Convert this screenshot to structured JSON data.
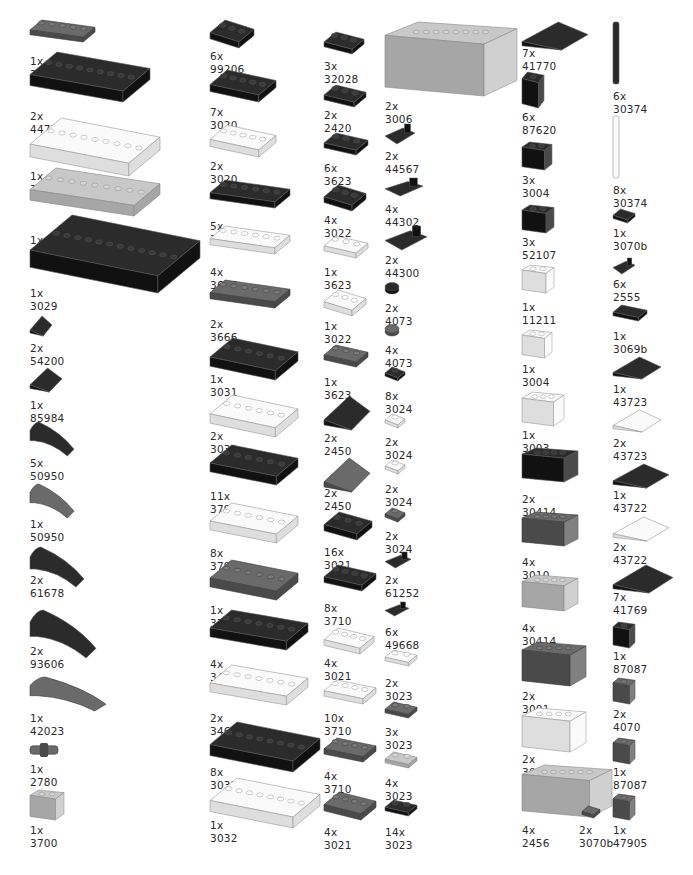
{
  "colors": {
    "black": "#1b1b1b",
    "dark_gray": "#5b5b5b",
    "light_gray": "#b9b9b9",
    "white": "#f4f4f4",
    "label": "#2a2a2a"
  },
  "parts": [
    {
      "qty": "1x",
      "id": "3020",
      "shape": "plate",
      "color": "dark_gray",
      "x": 30,
      "y": 20,
      "w": 65,
      "h": 22,
      "lx": 30,
      "ly": 55
    },
    {
      "qty": "2x",
      "id": "4477",
      "shape": "plate",
      "color": "black",
      "x": 30,
      "y": 52,
      "w": 120,
      "h": 50,
      "lx": 30,
      "ly": 110
    },
    {
      "qty": "1x",
      "id": "3958",
      "shape": "plate",
      "color": "white",
      "x": 30,
      "y": 118,
      "w": 130,
      "h": 58,
      "lx": 30,
      "ly": 170
    },
    {
      "qty": "1x",
      "id": "3832",
      "shape": "plate",
      "color": "light_gray",
      "x": 30,
      "y": 168,
      "w": 130,
      "h": 48,
      "lx": 30,
      "ly": 234
    },
    {
      "qty": "1x",
      "id": "3029",
      "shape": "plate",
      "color": "black",
      "x": 30,
      "y": 215,
      "w": 170,
      "h": 78,
      "lx": 30,
      "ly": 287
    },
    {
      "qty": "2x",
      "id": "54200",
      "shape": "slope",
      "color": "black",
      "x": 30,
      "y": 316,
      "w": 22,
      "h": 20,
      "lx": 30,
      "ly": 342
    },
    {
      "qty": "1x",
      "id": "85984",
      "shape": "slope",
      "color": "black",
      "x": 30,
      "y": 368,
      "w": 32,
      "h": 24,
      "lx": 30,
      "ly": 399
    },
    {
      "qty": "5x",
      "id": "50950",
      "shape": "curve",
      "color": "black",
      "x": 30,
      "y": 422,
      "w": 44,
      "h": 34,
      "lx": 30,
      "ly": 457
    },
    {
      "qty": "1x",
      "id": "50950",
      "shape": "curve",
      "color": "dark_gray",
      "x": 30,
      "y": 484,
      "w": 44,
      "h": 34,
      "lx": 30,
      "ly": 518
    },
    {
      "qty": "2x",
      "id": "61678",
      "shape": "curve",
      "color": "black",
      "x": 30,
      "y": 547,
      "w": 54,
      "h": 40,
      "lx": 30,
      "ly": 574
    },
    {
      "qty": "2x",
      "id": "93606",
      "shape": "curve",
      "color": "black",
      "x": 30,
      "y": 610,
      "w": 66,
      "h": 48,
      "lx": 30,
      "ly": 645
    },
    {
      "qty": "1x",
      "id": "42023",
      "shape": "curve",
      "color": "dark_gray",
      "x": 30,
      "y": 677,
      "w": 76,
      "h": 34,
      "lx": 30,
      "ly": 712
    },
    {
      "qty": "1x",
      "id": "2780",
      "shape": "pin",
      "color": "dark_gray",
      "x": 30,
      "y": 743,
      "w": 28,
      "h": 14,
      "lx": 30,
      "ly": 763
    },
    {
      "qty": "1x",
      "id": "3700",
      "shape": "brick",
      "color": "light_gray",
      "x": 30,
      "y": 790,
      "w": 34,
      "h": 30,
      "lx": 30,
      "ly": 824
    },
    {
      "qty": "6x",
      "id": "99206",
      "shape": "plate",
      "color": "black",
      "x": 210,
      "y": 20,
      "w": 44,
      "h": 28,
      "lx": 210,
      "ly": 50
    },
    {
      "qty": "7x",
      "id": "3020",
      "shape": "plate",
      "color": "black",
      "x": 210,
      "y": 70,
      "w": 66,
      "h": 32,
      "lx": 210,
      "ly": 106
    },
    {
      "qty": "2x",
      "id": "3020",
      "shape": "plate",
      "color": "white",
      "x": 210,
      "y": 125,
      "w": 66,
      "h": 32,
      "lx": 210,
      "ly": 160
    },
    {
      "qty": "5x",
      "id": "3666",
      "shape": "plate",
      "color": "black",
      "x": 210,
      "y": 180,
      "w": 80,
      "h": 28,
      "lx": 210,
      "ly": 220
    },
    {
      "qty": "4x",
      "id": "3666",
      "shape": "plate",
      "color": "white",
      "x": 210,
      "y": 226,
      "w": 80,
      "h": 28,
      "lx": 210,
      "ly": 266
    },
    {
      "qty": "2x",
      "id": "3666",
      "shape": "plate",
      "color": "dark_gray",
      "x": 210,
      "y": 280,
      "w": 80,
      "h": 28,
      "lx": 210,
      "ly": 318
    },
    {
      "qty": "1x",
      "id": "3031",
      "shape": "plate",
      "color": "black",
      "x": 210,
      "y": 338,
      "w": 88,
      "h": 42,
      "lx": 210,
      "ly": 373
    },
    {
      "qty": "2x",
      "id": "3031",
      "shape": "plate",
      "color": "white",
      "x": 210,
      "y": 395,
      "w": 88,
      "h": 42,
      "lx": 210,
      "ly": 430
    },
    {
      "qty": "11x",
      "id": "3795",
      "shape": "plate",
      "color": "black",
      "x": 210,
      "y": 445,
      "w": 88,
      "h": 40,
      "lx": 210,
      "ly": 490
    },
    {
      "qty": "8x",
      "id": "3795",
      "shape": "plate",
      "color": "white",
      "x": 210,
      "y": 503,
      "w": 88,
      "h": 40,
      "lx": 210,
      "ly": 547
    },
    {
      "qty": "1x",
      "id": "3795",
      "shape": "plate",
      "color": "dark_gray",
      "x": 210,
      "y": 560,
      "w": 88,
      "h": 40,
      "lx": 210,
      "ly": 604
    },
    {
      "qty": "4x",
      "id": "3460",
      "shape": "plate",
      "color": "black",
      "x": 210,
      "y": 610,
      "w": 98,
      "h": 40,
      "lx": 210,
      "ly": 658
    },
    {
      "qty": "2x",
      "id": "3460",
      "shape": "plate",
      "color": "white",
      "x": 210,
      "y": 665,
      "w": 98,
      "h": 40,
      "lx": 210,
      "ly": 712
    },
    {
      "qty": "8x",
      "id": "3032",
      "shape": "plate",
      "color": "black",
      "x": 210,
      "y": 722,
      "w": 110,
      "h": 50,
      "lx": 210,
      "ly": 766
    },
    {
      "qty": "1x",
      "id": "3032",
      "shape": "plate",
      "color": "white",
      "x": 210,
      "y": 778,
      "w": 110,
      "h": 50,
      "lx": 210,
      "ly": 819
    },
    {
      "qty": "3x",
      "id": "32028",
      "shape": "plate",
      "color": "black",
      "x": 324,
      "y": 32,
      "w": 40,
      "h": 22,
      "lx": 324,
      "ly": 60
    },
    {
      "qty": "2x",
      "id": "2420",
      "shape": "plate",
      "color": "black",
      "x": 324,
      "y": 85,
      "w": 42,
      "h": 22,
      "lx": 324,
      "ly": 109
    },
    {
      "qty": "6x",
      "id": "3623",
      "shape": "plate",
      "color": "black",
      "x": 324,
      "y": 133,
      "w": 44,
      "h": 22,
      "lx": 324,
      "ly": 162
    },
    {
      "qty": "4x",
      "id": "3022",
      "shape": "plate",
      "color": "black",
      "x": 324,
      "y": 185,
      "w": 42,
      "h": 26,
      "lx": 324,
      "ly": 214
    },
    {
      "qty": "1x",
      "id": "3623",
      "shape": "plate",
      "color": "white",
      "x": 324,
      "y": 236,
      "w": 44,
      "h": 22,
      "lx": 324,
      "ly": 266
    },
    {
      "qty": "1x",
      "id": "3022",
      "shape": "plate",
      "color": "white",
      "x": 324,
      "y": 290,
      "w": 42,
      "h": 26,
      "lx": 324,
      "ly": 320
    },
    {
      "qty": "1x",
      "id": "3623",
      "shape": "plate",
      "color": "dark_gray",
      "x": 324,
      "y": 345,
      "w": 44,
      "h": 22,
      "lx": 324,
      "ly": 376
    },
    {
      "qty": "2x",
      "id": "2450",
      "shape": "wedge",
      "color": "black",
      "x": 324,
      "y": 396,
      "w": 46,
      "h": 34,
      "lx": 324,
      "ly": 432
    },
    {
      "qty": "2x",
      "id": "2450",
      "shape": "wedge",
      "color": "dark_gray",
      "x": 324,
      "y": 458,
      "w": 46,
      "h": 34,
      "lx": 324,
      "ly": 487
    },
    {
      "qty": "16x",
      "id": "3021",
      "shape": "plate",
      "color": "black",
      "x": 324,
      "y": 512,
      "w": 48,
      "h": 28,
      "lx": 324,
      "ly": 546
    },
    {
      "qty": "8x",
      "id": "3710",
      "shape": "plate",
      "color": "black",
      "x": 324,
      "y": 565,
      "w": 52,
      "h": 26,
      "lx": 324,
      "ly": 602
    },
    {
      "qty": "4x",
      "id": "3021",
      "shape": "plate",
      "color": "white",
      "x": 324,
      "y": 628,
      "w": 50,
      "h": 26,
      "lx": 324,
      "ly": 657
    },
    {
      "qty": "10x",
      "id": "3710",
      "shape": "plate",
      "color": "white",
      "x": 324,
      "y": 680,
      "w": 52,
      "h": 24,
      "lx": 324,
      "ly": 712
    },
    {
      "qty": "4x",
      "id": "3710",
      "shape": "plate",
      "color": "dark_gray",
      "x": 324,
      "y": 738,
      "w": 52,
      "h": 24,
      "lx": 324,
      "ly": 770
    },
    {
      "qty": "4x",
      "id": "3021",
      "shape": "plate",
      "color": "dark_gray",
      "x": 324,
      "y": 792,
      "w": 52,
      "h": 28,
      "lx": 324,
      "ly": 826
    },
    {
      "qty": "2x",
      "id": "3006",
      "shape": "brick",
      "color": "light_gray",
      "x": 385,
      "y": 22,
      "w": 132,
      "h": 74,
      "lx": 385,
      "ly": 100
    },
    {
      "qty": "2x",
      "id": "44567",
      "shape": "clip",
      "color": "black",
      "x": 385,
      "y": 124,
      "w": 30,
      "h": 20,
      "lx": 385,
      "ly": 150
    },
    {
      "qty": "4x",
      "id": "44302",
      "shape": "clip",
      "color": "black",
      "x": 385,
      "y": 178,
      "w": 38,
      "h": 18,
      "lx": 385,
      "ly": 203
    },
    {
      "qty": "2x",
      "id": "44300",
      "shape": "clip",
      "color": "black",
      "x": 385,
      "y": 226,
      "w": 42,
      "h": 24,
      "lx": 385,
      "ly": 254
    },
    {
      "qty": "2x",
      "id": "4073",
      "shape": "round",
      "color": "black",
      "x": 385,
      "y": 282,
      "w": 14,
      "h": 12,
      "lx": 385,
      "ly": 302
    },
    {
      "qty": "4x",
      "id": "4073",
      "shape": "round",
      "color": "dark_gray",
      "x": 385,
      "y": 324,
      "w": 14,
      "h": 12,
      "lx": 385,
      "ly": 344
    },
    {
      "qty": "8x",
      "id": "3024",
      "shape": "plate",
      "color": "black",
      "x": 385,
      "y": 367,
      "w": 20,
      "h": 14,
      "lx": 385,
      "ly": 390
    },
    {
      "qty": "2x",
      "id": "3024",
      "shape": "plate",
      "color": "white",
      "x": 385,
      "y": 414,
      "w": 20,
      "h": 14,
      "lx": 385,
      "ly": 436
    },
    {
      "qty": "2x",
      "id": "3024",
      "shape": "plate",
      "color": "white",
      "x": 385,
      "y": 460,
      "w": 20,
      "h": 14,
      "lx": 385,
      "ly": 483
    },
    {
      "qty": "2x",
      "id": "3024",
      "shape": "plate",
      "color": "dark_gray",
      "x": 385,
      "y": 508,
      "w": 20,
      "h": 14,
      "lx": 385,
      "ly": 530
    },
    {
      "qty": "2x",
      "id": "61252",
      "shape": "clip",
      "color": "black",
      "x": 385,
      "y": 552,
      "w": 26,
      "h": 16,
      "lx": 385,
      "ly": 574
    },
    {
      "qty": "6x",
      "id": "49668",
      "shape": "clip",
      "color": "black",
      "x": 385,
      "y": 602,
      "w": 24,
      "h": 14,
      "lx": 385,
      "ly": 626
    },
    {
      "qty": "2x",
      "id": "3023",
      "shape": "plate",
      "color": "white",
      "x": 385,
      "y": 650,
      "w": 32,
      "h": 16,
      "lx": 385,
      "ly": 677
    },
    {
      "qty": "3x",
      "id": "3023",
      "shape": "plate",
      "color": "dark_gray",
      "x": 385,
      "y": 702,
      "w": 32,
      "h": 16,
      "lx": 385,
      "ly": 726
    },
    {
      "qty": "4x",
      "id": "3023",
      "shape": "plate",
      "color": "light_gray",
      "x": 385,
      "y": 752,
      "w": 32,
      "h": 16,
      "lx": 385,
      "ly": 777
    },
    {
      "qty": "14x",
      "id": "3023",
      "shape": "plate",
      "color": "black",
      "x": 385,
      "y": 800,
      "w": 32,
      "h": 16,
      "lx": 385,
      "ly": 826
    },
    {
      "qty": "7x",
      "id": "41770",
      "shape": "wedge",
      "color": "black",
      "x": 522,
      "y": 22,
      "w": 66,
      "h": 28,
      "lx": 522,
      "ly": 47
    },
    {
      "qty": "6x",
      "id": "87620",
      "shape": "brick",
      "color": "black",
      "x": 522,
      "y": 72,
      "w": 22,
      "h": 36,
      "lx": 522,
      "ly": 111
    },
    {
      "qty": "3x",
      "id": "3004",
      "shape": "brick",
      "color": "black",
      "x": 522,
      "y": 142,
      "w": 30,
      "h": 28,
      "lx": 522,
      "ly": 174
    },
    {
      "qty": "3x",
      "id": "52107",
      "shape": "brick",
      "color": "black",
      "x": 522,
      "y": 205,
      "w": 32,
      "h": 28,
      "lx": 522,
      "ly": 236
    },
    {
      "qty": "1x",
      "id": "11211",
      "shape": "brick",
      "color": "white",
      "x": 522,
      "y": 265,
      "w": 32,
      "h": 28,
      "lx": 522,
      "ly": 301
    },
    {
      "qty": "1x",
      "id": "3004",
      "shape": "brick",
      "color": "white",
      "x": 522,
      "y": 330,
      "w": 30,
      "h": 28,
      "lx": 522,
      "ly": 363
    },
    {
      "qty": "1x",
      "id": "3003",
      "shape": "brick",
      "color": "white",
      "x": 522,
      "y": 392,
      "w": 42,
      "h": 34,
      "lx": 522,
      "ly": 429
    },
    {
      "qty": "2x",
      "id": "30414",
      "shape": "brick",
      "color": "black",
      "x": 522,
      "y": 448,
      "w": 56,
      "h": 34,
      "lx": 522,
      "ly": 493
    },
    {
      "qty": "4x",
      "id": "3010",
      "shape": "brick",
      "color": "dark_gray",
      "x": 522,
      "y": 512,
      "w": 56,
      "h": 34,
      "lx": 522,
      "ly": 556
    },
    {
      "qty": "4x",
      "id": "30414",
      "shape": "brick",
      "color": "light_gray",
      "x": 522,
      "y": 575,
      "w": 56,
      "h": 36,
      "lx": 522,
      "ly": 622
    },
    {
      "qty": "2x",
      "id": "3001",
      "shape": "brick",
      "color": "dark_gray",
      "x": 522,
      "y": 642,
      "w": 64,
      "h": 44,
      "lx": 522,
      "ly": 690
    },
    {
      "qty": "2x",
      "id": "3001",
      "shape": "brick",
      "color": "white",
      "x": 522,
      "y": 708,
      "w": 64,
      "h": 44,
      "lx": 522,
      "ly": 753
    },
    {
      "qty": "4x",
      "id": "2456",
      "shape": "brick",
      "color": "light_gray",
      "x": 522,
      "y": 765,
      "w": 90,
      "h": 52,
      "lx": 522,
      "ly": 824
    },
    {
      "qty": "2x",
      "id": "3070b",
      "shape": "tile",
      "color": "dark_gray",
      "x": 582,
      "y": 806,
      "w": 18,
      "h": 12,
      "lx": 579,
      "ly": 824
    },
    {
      "qty": "6x",
      "id": "30374",
      "shape": "bar",
      "color": "black",
      "x": 613,
      "y": 22,
      "w": 6,
      "h": 62,
      "lx": 613,
      "ly": 90
    },
    {
      "qty": "8x",
      "id": "30374",
      "shape": "bar",
      "color": "white",
      "x": 613,
      "y": 116,
      "w": 6,
      "h": 62,
      "lx": 613,
      "ly": 184
    },
    {
      "qty": "1x",
      "id": "3070b",
      "shape": "tile",
      "color": "black",
      "x": 613,
      "y": 209,
      "w": 22,
      "h": 14,
      "lx": 613,
      "ly": 227
    },
    {
      "qty": "6x",
      "id": "2555",
      "shape": "clip",
      "color": "black",
      "x": 613,
      "y": 258,
      "w": 22,
      "h": 16,
      "lx": 613,
      "ly": 278
    },
    {
      "qty": "1x",
      "id": "3069b",
      "shape": "tile",
      "color": "black",
      "x": 613,
      "y": 305,
      "w": 34,
      "h": 16,
      "lx": 613,
      "ly": 330
    },
    {
      "qty": "1x",
      "id": "43723",
      "shape": "wedge",
      "color": "black",
      "x": 613,
      "y": 357,
      "w": 48,
      "h": 22,
      "lx": 613,
      "ly": 383
    },
    {
      "qty": "2x",
      "id": "43723",
      "shape": "wedge",
      "color": "white",
      "x": 613,
      "y": 410,
      "w": 48,
      "h": 22,
      "lx": 613,
      "ly": 437
    },
    {
      "qty": "1x",
      "id": "43722",
      "shape": "wedge",
      "color": "black",
      "x": 613,
      "y": 464,
      "w": 56,
      "h": 24,
      "lx": 613,
      "ly": 489
    },
    {
      "qty": "2x",
      "id": "43722",
      "shape": "wedge",
      "color": "white",
      "x": 613,
      "y": 517,
      "w": 56,
      "h": 24,
      "lx": 613,
      "ly": 541
    },
    {
      "qty": "7x",
      "id": "41769",
      "shape": "wedge",
      "color": "black",
      "x": 613,
      "y": 565,
      "w": 60,
      "h": 28,
      "lx": 613,
      "ly": 591
    },
    {
      "qty": "1x",
      "id": "87087",
      "shape": "brick",
      "color": "black",
      "x": 613,
      "y": 622,
      "w": 22,
      "h": 26,
      "lx": 613,
      "ly": 650
    },
    {
      "qty": "2x",
      "id": "4070",
      "shape": "brick",
      "color": "dark_gray",
      "x": 613,
      "y": 678,
      "w": 22,
      "h": 26,
      "lx": 613,
      "ly": 708
    },
    {
      "qty": "1x",
      "id": "87087",
      "shape": "brick",
      "color": "dark_gray",
      "x": 613,
      "y": 738,
      "w": 22,
      "h": 26,
      "lx": 613,
      "ly": 766
    },
    {
      "qty": "1x",
      "id": "47905",
      "shape": "brick",
      "color": "dark_gray",
      "x": 613,
      "y": 794,
      "w": 22,
      "h": 26,
      "lx": 613,
      "ly": 824
    }
  ]
}
